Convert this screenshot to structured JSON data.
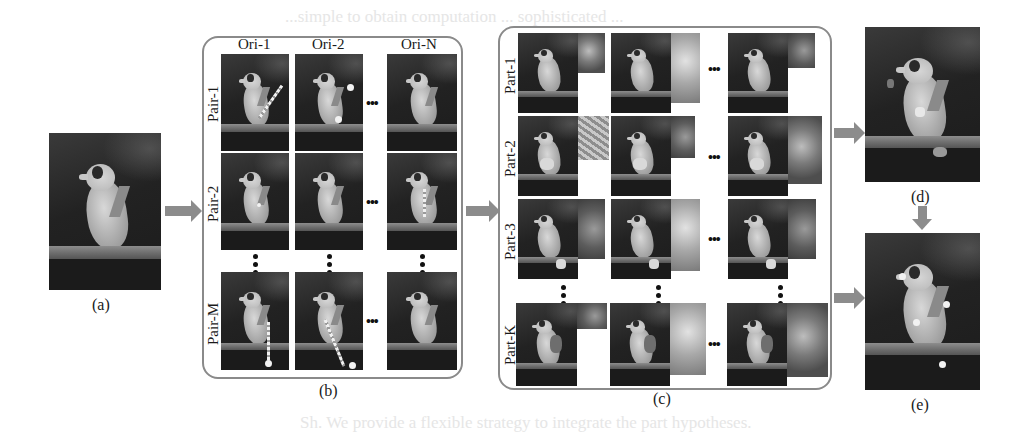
{
  "figure": {
    "background_text_fragments": [
      "...simple to obtain computation ... sophisticated ...",
      "Sh. We provide a flexible strategy to integrate the part hypotheses."
    ],
    "panel_a": {
      "caption": "(a)"
    },
    "panel_b": {
      "caption": "(b)",
      "column_headers": [
        "Ori-1",
        "Ori-2",
        "Ori-N"
      ],
      "row_labels": [
        "Pair-1",
        "Pair-2",
        "Pair-M"
      ],
      "ellipsis": "•••"
    },
    "panel_c": {
      "caption": "(c)",
      "row_labels": [
        "Part-1",
        "Part-2",
        "Part-3",
        "Part-K"
      ],
      "ellipsis": "•••"
    },
    "panel_d": {
      "caption": "(d)"
    },
    "panel_e": {
      "caption": "(e)"
    },
    "colors": {
      "arrow": "#8c8c8c",
      "frame_border": "#8a8a8a",
      "text": "#1a1a1a"
    },
    "icons": [
      "arrow-right-icon",
      "arrow-down-icon",
      "ellipsis-icon"
    ]
  }
}
